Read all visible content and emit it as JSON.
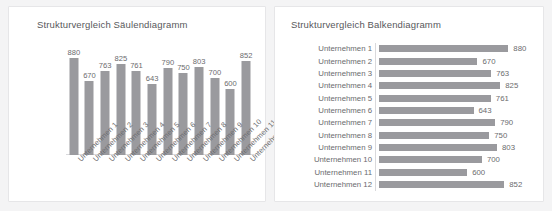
{
  "chart_data": [
    {
      "type": "bar",
      "orientation": "vertical",
      "title": "Strukturvergleich Säulendiagramm",
      "categories": [
        "Unternehmen 1",
        "Unternehmen 2",
        "Unternehmen 3",
        "Unternehmen 4",
        "Unternehmen 5",
        "Unternehmen 6",
        "Unternehmen 7",
        "Unternehmen 8",
        "Unternehmen 9",
        "Unternehmen 10",
        "Unternehmen 11",
        "Unternehmen 12"
      ],
      "values": [
        880,
        670,
        763,
        825,
        761,
        643,
        790,
        750,
        803,
        700,
        600,
        852
      ],
      "xlabel": "",
      "ylabel": "",
      "ylim": [
        0,
        880
      ],
      "grid": false,
      "legend": false,
      "data_labels": true,
      "bar_color": "#9a9a9e",
      "axis_color": "#d9d9dc",
      "text_color": "#6b6b6e",
      "tick_label_rotation": -45
    },
    {
      "type": "bar",
      "orientation": "horizontal",
      "title": "Strukturvergleich Balkendiagramm",
      "categories": [
        "Unternehmen 1",
        "Unternehmen 2",
        "Unternehmen 3",
        "Unternehmen 4",
        "Unternehmen 5",
        "Unternehmen 6",
        "Unternehmen 7",
        "Unternehmen 8",
        "Unternehmen 9",
        "Unternehmen 10",
        "Unternehmen 11",
        "Unternehmen 12"
      ],
      "values": [
        880,
        670,
        763,
        825,
        761,
        643,
        790,
        750,
        803,
        700,
        600,
        852
      ],
      "xlabel": "",
      "ylabel": "",
      "xlim": [
        0,
        880
      ],
      "grid": false,
      "legend": false,
      "data_labels": true,
      "bar_color": "#9a9a9e",
      "axis_color": "#d9d9dc",
      "text_color": "#6b6b6e"
    }
  ],
  "page": {
    "background": "#f4f4f5",
    "card_background": "#ffffff"
  }
}
